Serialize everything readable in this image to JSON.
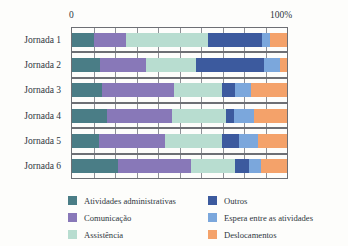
{
  "chart_data": {
    "type": "bar",
    "orientation": "horizontal",
    "stacked": true,
    "normalized": true,
    "title": "",
    "xlabel": "",
    "ylabel": "",
    "xlim": [
      0,
      100
    ],
    "x_tick_labels": [
      "0",
      "100%"
    ],
    "grid": true,
    "gridline_interval": 10,
    "legend_position": "bottom",
    "categories": [
      "Jornada 1",
      "Jornada 2",
      "Jornada 3",
      "Jornada 4",
      "Jornada 5",
      "Jornada 6"
    ],
    "series": [
      {
        "name": "Atividades administrativas",
        "color": "#4a7d86",
        "values": [
          10.1,
          12.9,
          13.8,
          16.1,
          12.4,
          21.2
        ]
      },
      {
        "name": "Comunicação",
        "color": "#8878b8",
        "values": [
          15.2,
          21.7,
          33.6,
          30.4,
          30.9,
          34.1
        ]
      },
      {
        "name": "Assistência",
        "color": "#b8ddd0",
        "values": [
          37.8,
          23.0,
          22.6,
          24.9,
          26.3,
          20.7
        ]
      },
      {
        "name": "Outros",
        "color": "#3c5a9e",
        "values": [
          25.3,
          31.8,
          6.0,
          4.1,
          8.3,
          6.5
        ]
      },
      {
        "name": "Espera entre as atividades",
        "color": "#7ba7dc",
        "values": [
          3.7,
          7.4,
          7.4,
          9.2,
          8.8,
          5.5
        ]
      },
      {
        "name": "Deslocamentos",
        "color": "#f4a26a",
        "values": [
          7.9,
          3.2,
          16.6,
          15.3,
          13.3,
          12.0
        ]
      }
    ]
  },
  "axis": {
    "zero_label": "0",
    "hundred_label": "100%"
  },
  "legend": {
    "columns": [
      [
        {
          "label": "Atividades administrativas",
          "color": "#4a7d86"
        },
        {
          "label": "Comunicação",
          "color": "#8878b8"
        },
        {
          "label": "Assistência",
          "color": "#b8ddd0"
        }
      ],
      [
        {
          "label": "Outros",
          "color": "#3c5a9e"
        },
        {
          "label": "Espera entre as atividades",
          "color": "#7ba7dc"
        },
        {
          "label": "Deslocamentos",
          "color": "#f4a26a"
        }
      ]
    ]
  }
}
